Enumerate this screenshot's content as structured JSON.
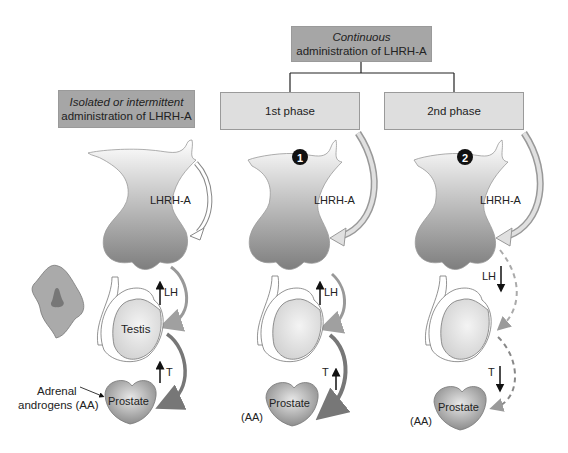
{
  "header": {
    "continuous_box": {
      "line1": "Continuous",
      "line2": "administration of LHRH-A"
    },
    "isolated_box": {
      "line1": "Isolated or intermittent",
      "line2": "administration of LHRH-A"
    },
    "phase1_box": {
      "label": "1st phase"
    },
    "phase2_box": {
      "label": "2nd phase"
    }
  },
  "panels": [
    {
      "id": "isolated",
      "hormone_label": "LHRH-A",
      "lh_label": "LH",
      "lh_direction": "up",
      "testis_label": "Testis",
      "t_label": "T",
      "t_direction": "up",
      "prostate_label": "Prostate",
      "adrenal_label_line1": "Adrenal",
      "adrenal_label_line2": "androgens (AA)"
    },
    {
      "id": "phase1",
      "marker": "1",
      "hormone_label": "LHRH-A",
      "lh_label": "LH",
      "lh_direction": "up",
      "t_label": "T",
      "t_direction": "up",
      "prostate_label": "Prostate",
      "aa_label": "(AA)"
    },
    {
      "id": "phase2",
      "marker": "2",
      "hormone_label": "LHRH-A",
      "lh_label": "LH",
      "lh_direction": "down",
      "t_label": "T",
      "t_direction": "down",
      "prostate_label": "Prostate",
      "aa_label": "(AA)"
    }
  ],
  "colors": {
    "dark_box": "#a6a6a6",
    "light_box": "#dedede",
    "pituitary_dark": "#8a8a8a",
    "arrow_gray": "#9a9a9a"
  }
}
